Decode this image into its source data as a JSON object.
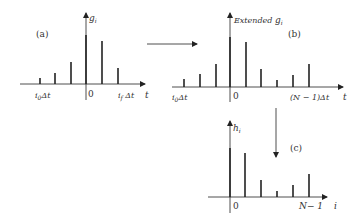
{
  "colors": {
    "ink": "#222222",
    "text": "#333333",
    "background": "#ffffff"
  },
  "panel_a": {
    "label": "(a)",
    "y_label": "g",
    "y_sub": "i",
    "x_label": "t",
    "origin_label": "0",
    "left_tick_label": "i",
    "left_tick_sub": "0",
    "left_tick_suffix": "Δt",
    "right_tick_label": "i",
    "right_tick_sub": "f",
    "right_tick_suffix": " Δt",
    "stems": [
      {
        "x": 40,
        "top": 78
      },
      {
        "x": 55,
        "top": 73
      },
      {
        "x": 71,
        "top": 62
      },
      {
        "x": 86,
        "top": 35
      },
      {
        "x": 102,
        "top": 41
      },
      {
        "x": 118,
        "top": 68
      }
    ]
  },
  "panel_b": {
    "label": "(b)",
    "y_label_prefix": "Extended ",
    "y_label": "g",
    "y_sub": "i",
    "x_label": "t",
    "origin_label": "0",
    "left_tick_label": "i",
    "left_tick_sub": "0",
    "left_tick_suffix": "Δt",
    "right_tick_label": "(N − 1)Δt",
    "stems": [
      {
        "x": 184,
        "top": 79
      },
      {
        "x": 200,
        "top": 74
      },
      {
        "x": 216,
        "top": 64
      },
      {
        "x": 230,
        "top": 37
      },
      {
        "x": 246,
        "top": 42
      },
      {
        "x": 261,
        "top": 69
      },
      {
        "x": 277,
        "top": 80
      },
      {
        "x": 293,
        "top": 75
      },
      {
        "x": 309,
        "top": 64
      }
    ]
  },
  "panel_c": {
    "label": "(c)",
    "y_label": "h",
    "y_sub": "i",
    "x_label": "i",
    "origin_label": "0",
    "right_tick_label": "N− 1",
    "stems": [
      {
        "x": 230,
        "top": 148
      },
      {
        "x": 245,
        "top": 153
      },
      {
        "x": 261,
        "top": 180
      },
      {
        "x": 277,
        "top": 191
      },
      {
        "x": 293,
        "top": 185
      },
      {
        "x": 309,
        "top": 174
      }
    ]
  },
  "arrows": {
    "a_to_b": "right-arrow",
    "b_to_c": "down-arrow"
  }
}
